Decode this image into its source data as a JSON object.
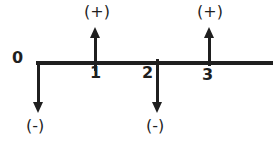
{
  "diagram": {
    "type": "sign-convention-number-line",
    "background": "#ffffff",
    "ink_color": "#1f1f1f",
    "axis": {
      "tick_labels": [
        "0",
        "1",
        "2",
        "3"
      ]
    },
    "markers": [
      {
        "at": "0",
        "direction": "down",
        "sign": "(-)"
      },
      {
        "at": "1",
        "direction": "up",
        "sign": "(+)"
      },
      {
        "at": "2",
        "direction": "down",
        "sign": "(-)"
      },
      {
        "at": "3",
        "direction": "up",
        "sign": "(+)"
      }
    ]
  }
}
